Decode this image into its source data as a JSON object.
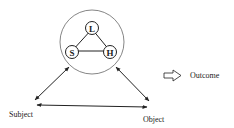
{
  "diagram": {
    "nodes": {
      "L": "L",
      "S": "S",
      "H": "H"
    },
    "labels": {
      "subject": "Subject",
      "object": "Object",
      "outcome": "Outcome"
    },
    "colors": {
      "stroke": "#222222",
      "circle_stroke": "#666666"
    }
  }
}
